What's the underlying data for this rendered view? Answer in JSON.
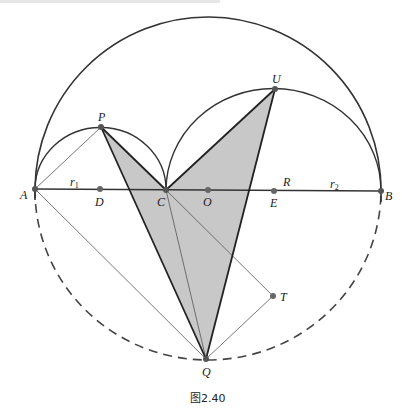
{
  "figure": {
    "caption": "图2.40",
    "colors": {
      "stroke": "#333333",
      "thin_stroke": "#555555",
      "shade": "#c8c8c8",
      "point": "#555555"
    },
    "points": {
      "A": {
        "label": "A",
        "x": 35,
        "y": 189
      },
      "B": {
        "label": "B",
        "x": 381,
        "y": 191
      },
      "C": {
        "label": "C",
        "x": 166,
        "y": 190
      },
      "D": {
        "label": "D",
        "x": 100,
        "y": 189
      },
      "O": {
        "label": "O",
        "x": 208,
        "y": 190
      },
      "E": {
        "label": "E",
        "x": 274,
        "y": 191
      },
      "P": {
        "label": "P",
        "x": 101,
        "y": 127
      },
      "U": {
        "label": "U",
        "x": 275,
        "y": 89
      },
      "Q": {
        "label": "Q",
        "x": 206,
        "y": 359
      },
      "T": {
        "label": "T",
        "x": 273,
        "y": 296
      }
    },
    "segment_labels": {
      "r1": {
        "main": "r",
        "sub": "1"
      },
      "R": {
        "main": "R"
      },
      "r2": {
        "main": "r",
        "sub": "2"
      }
    },
    "shaded_polygon": [
      "P",
      "C",
      "U",
      "Q"
    ],
    "thick_segments": [
      [
        "A",
        "B"
      ],
      [
        "P",
        "C"
      ],
      [
        "C",
        "U"
      ],
      [
        "U",
        "Q"
      ],
      [
        "P",
        "Q"
      ]
    ],
    "thin_segments": [
      [
        "A",
        "P"
      ],
      [
        "A",
        "Q"
      ],
      [
        "C",
        "Q"
      ],
      [
        "C",
        "T"
      ],
      [
        "T",
        "Q"
      ]
    ],
    "arcs": [
      {
        "name": "big-semicircle",
        "center": "O",
        "radius": 173,
        "style": "solid",
        "half": "upper"
      },
      {
        "name": "big-lower-semicircle",
        "center": "O",
        "radius": 173,
        "style": "dashed",
        "half": "lower"
      },
      {
        "name": "left-semicircle",
        "center": "D",
        "radius": 65.5,
        "style": "solid",
        "half": "upper"
      },
      {
        "name": "right-semicircle",
        "center": "E",
        "radius": 107.5,
        "style": "solid",
        "half": "upper"
      }
    ]
  }
}
